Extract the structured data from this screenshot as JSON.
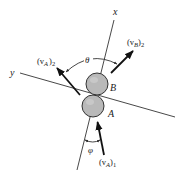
{
  "diagram": {
    "axes": {
      "x": {
        "label": "x",
        "from": [
          114,
          20
        ],
        "to": [
          77,
          170
        ]
      },
      "y": {
        "label": "y",
        "from": [
          20,
          73
        ],
        "to": [
          175,
          117
        ]
      }
    },
    "bodies": [
      {
        "id": "B",
        "label": "B",
        "center": [
          97,
          84
        ],
        "radius": 11,
        "fill": "#b9b9b9"
      },
      {
        "id": "A",
        "label": "A",
        "center": [
          93,
          106
        ],
        "radius": 11,
        "fill": "#b9b9b9"
      }
    ],
    "vectors": [
      {
        "id": "vA1",
        "label_main": "(v",
        "label_sub_inner": "A",
        "label_close": ")",
        "label_sub_outer": "1",
        "tail": [
          104,
          155
        ],
        "head": [
          97,
          121
        ]
      },
      {
        "id": "vA2",
        "label_main": "(v",
        "label_sub_inner": "A",
        "label_close": ")",
        "label_sub_outer": "2",
        "tail": [
          80,
          95
        ],
        "head": [
          56,
          67
        ]
      },
      {
        "id": "vB2",
        "label_main": "(v",
        "label_sub_inner": "B",
        "label_close": ")",
        "label_sub_outer": "2",
        "tail": [
          111,
          73
        ],
        "head": [
          133,
          51
        ]
      }
    ],
    "angles": [
      {
        "id": "theta",
        "label": "θ",
        "between": [
          "vA2",
          "vB2"
        ]
      },
      {
        "id": "phi",
        "label": "φ",
        "between": [
          "x-axis",
          "vA1"
        ]
      }
    ],
    "colors": {
      "line": "#333333",
      "vector": "#111111",
      "sphere": "#b9b9b9",
      "background": "#ffffff"
    }
  }
}
